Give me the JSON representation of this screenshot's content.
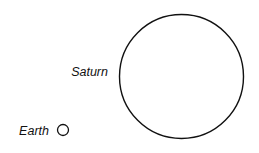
{
  "diagram": {
    "title": "",
    "bodies": [
      {
        "id": "saturn",
        "label": "Saturn",
        "cx": 181.5,
        "cy": 76.5,
        "r": 62
      },
      {
        "id": "earth",
        "label": "Earth",
        "cx": 63,
        "cy": 130,
        "r": 5.5
      }
    ],
    "stroke_color": "#111111",
    "background": "#ffffff"
  }
}
